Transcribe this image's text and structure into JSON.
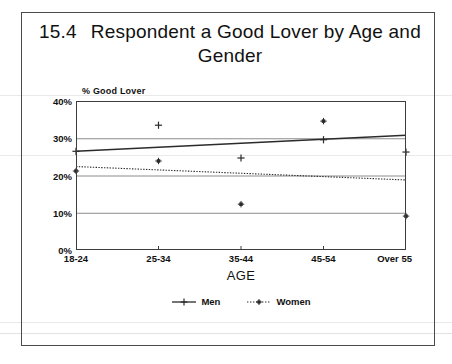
{
  "chart_data": {
    "type": "scatter",
    "title": "Respondent a Good Lover by Age and Gender",
    "title_number": "15.4",
    "xlabel": "AGE",
    "ylabel": "% Good Lover",
    "categories": [
      "18-24",
      "25-34",
      "35-44",
      "45-54",
      "Over 55"
    ],
    "ytick_labels": [
      "0%",
      "10%",
      "20%",
      "30%",
      "40%"
    ],
    "ytick_values": [
      0,
      10,
      20,
      30,
      40
    ],
    "ylim": [
      0,
      40
    ],
    "grid": true,
    "legend_position": "bottom",
    "series": [
      {
        "name": "Men",
        "marker": "plus",
        "line_style": "solid",
        "values": [
          26.5,
          33.5,
          24.7,
          29.6,
          26.3
        ],
        "trend_start": 26.5,
        "trend_end": 30.8
      },
      {
        "name": "Women",
        "marker": "star",
        "line_style": "dotted",
        "values": [
          21.2,
          23.9,
          12.3,
          34.6,
          9.1
        ],
        "trend_start": 22.4,
        "trend_end": 18.8
      }
    ]
  },
  "legend": {
    "items": [
      {
        "label": "Men"
      },
      {
        "label": "Women"
      }
    ]
  },
  "colors": {
    "line": "#2b2b2b",
    "grid": "#8c8c8c",
    "frame": "#3d3d3d",
    "text": "#111111"
  }
}
